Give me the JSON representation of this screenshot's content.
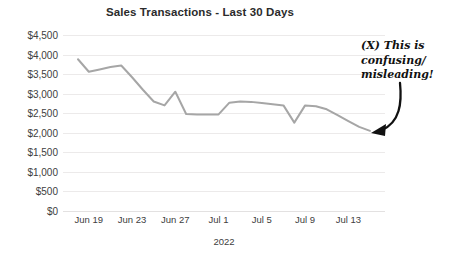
{
  "chart_data": {
    "type": "line",
    "title": "Sales Transactions - Last 30 Days",
    "xlabel": "2022",
    "ylabel": "",
    "ylim": [
      0,
      4500
    ],
    "ytick_labels": [
      "$4,500",
      "$4,000",
      "$3,500",
      "$3,000",
      "$2,500",
      "$2,000",
      "$1,500",
      "$1,000",
      "$500",
      "$0"
    ],
    "ytick_values": [
      4500,
      4000,
      3500,
      3000,
      2500,
      2000,
      1500,
      1000,
      500,
      0
    ],
    "xtick_labels": [
      "Jun 19",
      "Jun 23",
      "Jun 27",
      "Jul 1",
      "Jul 5",
      "Jul 9",
      "Jul 13"
    ],
    "xtick_values": [
      "2022-06-19",
      "2022-06-23",
      "2022-06-27",
      "2022-07-01",
      "2022-07-05",
      "2022-07-09",
      "2022-07-13"
    ],
    "x": [
      "2022-06-18",
      "2022-06-19",
      "2022-06-20",
      "2022-06-21",
      "2022-06-22",
      "2022-06-23",
      "2022-06-24",
      "2022-06-25",
      "2022-06-26",
      "2022-06-27",
      "2022-06-28",
      "2022-06-29",
      "2022-06-30",
      "2022-07-01",
      "2022-07-02",
      "2022-07-03",
      "2022-07-04",
      "2022-07-05",
      "2022-07-06",
      "2022-07-07",
      "2022-07-08",
      "2022-07-09",
      "2022-07-10",
      "2022-07-11",
      "2022-07-12",
      "2022-07-13",
      "2022-07-14",
      "2022-07-15"
    ],
    "values": [
      3880,
      3560,
      3620,
      3680,
      3720,
      3420,
      3100,
      2800,
      2700,
      3050,
      2480,
      2470,
      2470,
      2470,
      2770,
      2800,
      2790,
      2760,
      2730,
      2700,
      2260,
      2700,
      2680,
      2600,
      2450,
      2300,
      2150,
      2050
    ],
    "grid": true,
    "legend": false,
    "line_color": "#a6a6a6",
    "annotations": [
      {
        "text": "(X) This is\nconfusing/\nmisleading!",
        "style": "handwritten-marker",
        "color": "#111111",
        "arrow": "curved-arrow-down-left",
        "points_to": "series-end"
      }
    ]
  },
  "colors": {
    "line": "#a6a6a6",
    "grid": "#eceaea",
    "text": "#404040",
    "title": "#2b2b2b",
    "annotation": "#111111",
    "background": "#ffffff"
  }
}
